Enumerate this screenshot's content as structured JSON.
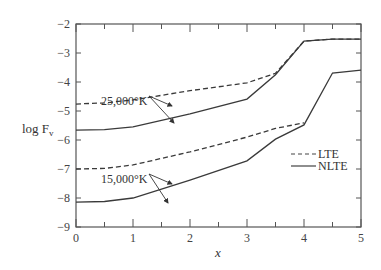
{
  "chart_data": {
    "type": "line",
    "title": "",
    "xlabel": "x",
    "ylabel": "log F_v",
    "ylabel_display": {
      "main": "log F",
      "sub": "v"
    },
    "xlim": [
      0,
      5
    ],
    "ylim": [
      -9,
      -2
    ],
    "xticks": [
      0,
      1,
      2,
      3,
      4,
      5
    ],
    "yticks": [
      -2,
      -3,
      -4,
      -5,
      -6,
      -7,
      -8,
      -9
    ],
    "xtick_labels": [
      "0",
      "1",
      "2",
      "3",
      "4",
      "5"
    ],
    "ytick_labels": [
      "−2",
      "−3",
      "−4",
      "−5",
      "−6",
      "−7",
      "−8",
      "−9"
    ],
    "grid": false,
    "legend": {
      "position": "right-middle",
      "entries": [
        {
          "label": "LTE",
          "style": "dashed"
        },
        {
          "label": "NLTE",
          "style": "solid"
        }
      ]
    },
    "annotations": [
      {
        "text": "25,000°K",
        "x": 1.5,
        "y": -4.25
      },
      {
        "text": "15,000°K",
        "x": 1.5,
        "y": -6.5
      }
    ],
    "series": [
      {
        "name": "LTE 25,000°K",
        "style": "dashed",
        "x": [
          0,
          0.5,
          1,
          2,
          3,
          3.5,
          4,
          4.5,
          5
        ],
        "y": [
          -4.76,
          -4.72,
          -4.62,
          -4.3,
          -4.03,
          -3.7,
          -2.59,
          -2.52,
          -2.52
        ]
      },
      {
        "name": "NLTE 25,000°K",
        "style": "solid",
        "x": [
          0,
          0.5,
          1,
          2,
          3,
          3.5,
          4,
          4.5,
          5
        ],
        "y": [
          -5.66,
          -5.64,
          -5.55,
          -5.1,
          -4.59,
          -3.75,
          -2.59,
          -2.52,
          -2.52
        ]
      },
      {
        "name": "LTE 15,000°K",
        "style": "dashed",
        "x": [
          0,
          0.5,
          1,
          2,
          3,
          3.5,
          4
        ],
        "y": [
          -7.0,
          -6.98,
          -6.86,
          -6.41,
          -5.9,
          -5.6,
          -5.41
        ]
      },
      {
        "name": "NLTE 15,000°K",
        "style": "solid",
        "x": [
          0,
          0.5,
          1,
          2,
          3,
          3.5,
          4,
          4.5,
          5
        ],
        "y": [
          -8.14,
          -8.12,
          -8.0,
          -7.38,
          -6.72,
          -5.97,
          -5.48,
          -3.69,
          -3.59
        ]
      }
    ]
  }
}
